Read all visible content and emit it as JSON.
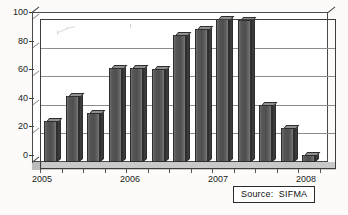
{
  "chart_data": {
    "type": "bar",
    "title": "",
    "subtitle": "",
    "xlabel": "",
    "ylabel": "",
    "ylim": [
      0,
      100
    ],
    "yticks": [
      0,
      20,
      40,
      60,
      80,
      100
    ],
    "grid": true,
    "legend": null,
    "categories": [
      "2005 Q1",
      "2005 Q2",
      "2005 Q3",
      "2005 Q4",
      "2006 Q1",
      "2006 Q2",
      "2006 Q3",
      "2006 Q4",
      "2007 Q1",
      "2007 Q2",
      "2007 Q3",
      "2007 Q4",
      "2008 Q1"
    ],
    "values": [
      29,
      46,
      34,
      66,
      66,
      65,
      89,
      93,
      100,
      99,
      40,
      24,
      5
    ],
    "xtick_labels": [
      "2005",
      "2006",
      "2007",
      "2008"
    ],
    "annotations": [
      "Source:  SIFMA"
    ],
    "bar_color": "#4e4e4e",
    "grid_color": "#8d8d8d",
    "axis_color": "#3d3d3d",
    "background_color": "#ffffff"
  },
  "axes": {
    "y_labels": [
      "100",
      "80",
      "60",
      "40",
      "20",
      "0"
    ],
    "x_labels": [
      "2005",
      "2006",
      "2007",
      "2008"
    ]
  },
  "source": {
    "label": "Source:  SIFMA"
  }
}
